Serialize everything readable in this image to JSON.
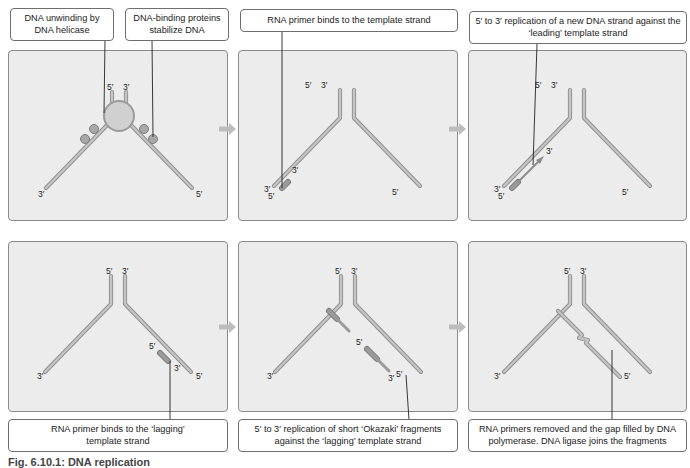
{
  "figure": {
    "caption": "Fig. 6.10.1: DNA replication",
    "colors": {
      "panel_bg": "#ececec",
      "panel_border": "#8a8a8a",
      "strand": "#b3b3b3",
      "strand_edge": "#8f8f8f",
      "primer": "#8c8c8c",
      "helicase": "#cfcfcf",
      "ssb": "#9a9a9a",
      "arrow": "#b8b8b8",
      "leader_line": "#222222"
    },
    "panels": [
      {
        "id": "helicase",
        "step": 1,
        "callouts": [
          {
            "text": "DNA unwinding by DNA helicase"
          },
          {
            "text": "DNA-binding proteins stabilize DNA"
          }
        ],
        "labels": {
          "top_left": "5′",
          "top_right": "3′",
          "bottom_left": "3′",
          "bottom_right": "5′"
        }
      },
      {
        "id": "primer-leading",
        "step": 2,
        "callouts": [
          {
            "text": "RNA primer binds to the template strand"
          }
        ],
        "labels": {
          "top_left": "5′",
          "top_right": "3′",
          "bottom_left": "3′",
          "bottom_right": "5′",
          "primer_5": "5′",
          "primer_3": "3′"
        }
      },
      {
        "id": "leading-replication",
        "step": 3,
        "callouts": [
          {
            "text": "5′ to 3′ replication of a new DNA strand against the ‘leading’ template strand"
          }
        ],
        "labels": {
          "top_left": "5′",
          "top_right": "3′",
          "bottom_left": "3′",
          "bottom_right": "5′",
          "primer_5": "5′",
          "arrow_3": "3′"
        }
      },
      {
        "id": "primer-lagging",
        "step": 4,
        "callouts": [
          {
            "text": "RNA primer binds to the ‘lagging’ template strand"
          }
        ],
        "labels": {
          "top_left": "5′",
          "top_right": "3′",
          "bottom_left": "3′",
          "bottom_right": "5′",
          "primer_5": "5′",
          "primer_3": "3′"
        }
      },
      {
        "id": "okazaki",
        "step": 5,
        "callouts": [
          {
            "text": "5′ to 3′ replication of short ‘Okazaki’ fragments against the ‘lagging’ template strand"
          }
        ],
        "labels": {
          "top_left": "5′",
          "top_right": "3′",
          "bottom_left": "3′",
          "bottom_right": "5′",
          "frag_5": "5′",
          "frag_3": "3′"
        }
      },
      {
        "id": "ligase",
        "step": 6,
        "callouts": [
          {
            "text": "RNA primers removed and the gap filled by DNA polymerase. DNA ligase joins the fragments"
          }
        ],
        "labels": {
          "top_left": "5′",
          "top_right": "3′",
          "bottom_left": "3′",
          "bottom_right": "5′"
        }
      }
    ]
  }
}
